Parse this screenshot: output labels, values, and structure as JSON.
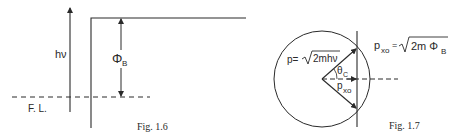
{
  "figures": [
    {
      "id": "fig-1-6",
      "caption": "Fig. 1.6",
      "labels": {
        "photon_energy": "hν",
        "barrier_height_symbol": "Φ",
        "barrier_height_sub": "B",
        "fermi_level": "F. L."
      }
    },
    {
      "id": "fig-1-7",
      "caption": "Fig. 1.7",
      "labels": {
        "momentum_lhs": "p=",
        "momentum_rhs": "2mhν",
        "angle_symbol": "θ",
        "angle_sub": "C",
        "pxo_symbol": "p",
        "pxo_sub": "xo",
        "pxo_eq_lhs_symbol": "p",
        "pxo_eq_lhs_sub": "xo",
        "pxo_eq_equals": "=",
        "pxo_eq_rhs": "2m Φ",
        "pxo_eq_rhs_sub": "B"
      }
    }
  ],
  "colors": {
    "ink": "#2a2a2a",
    "background": "#ffffff"
  }
}
